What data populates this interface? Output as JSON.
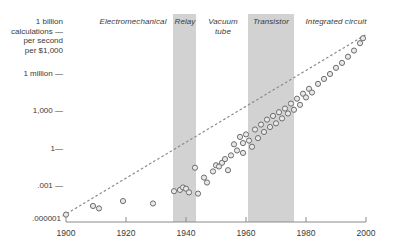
{
  "chart_data": {
    "type": "scatter",
    "title": "",
    "xlabel": "",
    "ylabel": "1 billion calculations per second per $1,000",
    "xlim": [
      1900,
      2000
    ],
    "ylim_log10": [
      -6,
      9
    ],
    "grid": false,
    "legend_position": "none",
    "y_tick_labels": [
      "1 billion\ncalculations —\nper second\nper $1,000",
      "1 million —",
      "1,000 —",
      "1—",
      ".001 —",
      ".000001"
    ],
    "y_tick_values": [
      1000000000,
      1000000,
      1000,
      1,
      0.001,
      1e-06
    ],
    "x_tick_labels": [
      "1900",
      "1920",
      "1940",
      "1960",
      "1980",
      "2000"
    ],
    "x_tick_values": [
      1900,
      1920,
      1940,
      1960,
      1980,
      2000
    ],
    "eras": [
      {
        "name": "Electromechanical",
        "shaded": false,
        "start": 1900,
        "end": 1935,
        "label_x": 1912,
        "label_y_px": 22
      },
      {
        "name": "Relay",
        "shaded": true,
        "start": 1936,
        "end": 1943,
        "label_x": 1939,
        "label_y_px": 22
      },
      {
        "name": "Vacuum\ntube",
        "shaded": false,
        "start": 1944,
        "end": 1960,
        "label_x": 1951,
        "label_y_px": 22
      },
      {
        "name": "Transistor",
        "shaded": true,
        "start": 1961,
        "end": 1976,
        "label_x": 1968,
        "label_y_px": 22
      },
      {
        "name": "Integrated\ncircuit",
        "shaded": false,
        "start": 1977,
        "end": 2000,
        "label_x": 1987,
        "label_y_px": 22
      }
    ],
    "trendline": {
      "x_start": 1899,
      "y_start_log10": -5.5,
      "x_end": 2000,
      "y_end_log10": 9.2,
      "style": "dotted"
    },
    "points": [
      {
        "x": 1900,
        "y_log10": -5.4
      },
      {
        "x": 1909,
        "y_log10": -4.7
      },
      {
        "x": 1911,
        "y_log10": -4.9
      },
      {
        "x": 1919,
        "y_log10": -4.3
      },
      {
        "x": 1929,
        "y_log10": -4.5
      },
      {
        "x": 1936,
        "y_log10": -3.5
      },
      {
        "x": 1938,
        "y_log10": -3.4
      },
      {
        "x": 1939,
        "y_log10": -3.2
      },
      {
        "x": 1940,
        "y_log10": -3.3
      },
      {
        "x": 1941,
        "y_log10": -3.6
      },
      {
        "x": 1943,
        "y_log10": -1.6
      },
      {
        "x": 1944,
        "y_log10": -3.7
      },
      {
        "x": 1946,
        "y_log10": -2.4
      },
      {
        "x": 1947,
        "y_log10": -2.8
      },
      {
        "x": 1949,
        "y_log10": -1.9
      },
      {
        "x": 1950,
        "y_log10": -1.4
      },
      {
        "x": 1951,
        "y_log10": -1.5
      },
      {
        "x": 1952,
        "y_log10": -1.2
      },
      {
        "x": 1953,
        "y_log10": -0.9
      },
      {
        "x": 1954,
        "y_log10": -1.8
      },
      {
        "x": 1955,
        "y_log10": -0.6
      },
      {
        "x": 1956,
        "y_log10": 0.3
      },
      {
        "x": 1957,
        "y_log10": -0.2
      },
      {
        "x": 1958,
        "y_log10": 0.9
      },
      {
        "x": 1959,
        "y_log10": 0.4
      },
      {
        "x": 1959,
        "y_log10": -0.4
      },
      {
        "x": 1960,
        "y_log10": 1.1
      },
      {
        "x": 1961,
        "y_log10": 0.6
      },
      {
        "x": 1962,
        "y_log10": 0.1
      },
      {
        "x": 1963,
        "y_log10": 1.5
      },
      {
        "x": 1964,
        "y_log10": 0.8
      },
      {
        "x": 1965,
        "y_log10": 1.9
      },
      {
        "x": 1966,
        "y_log10": 1.3
      },
      {
        "x": 1967,
        "y_log10": 2.3
      },
      {
        "x": 1968,
        "y_log10": 1.7
      },
      {
        "x": 1969,
        "y_log10": 2.6
      },
      {
        "x": 1970,
        "y_log10": 2.0
      },
      {
        "x": 1971,
        "y_log10": 2.9
      },
      {
        "x": 1972,
        "y_log10": 2.4
      },
      {
        "x": 1973,
        "y_log10": 3.2
      },
      {
        "x": 1974,
        "y_log10": 2.8
      },
      {
        "x": 1975,
        "y_log10": 3.6
      },
      {
        "x": 1976,
        "y_log10": 3.1
      },
      {
        "x": 1977,
        "y_log10": 4.0
      },
      {
        "x": 1978,
        "y_log10": 3.5
      },
      {
        "x": 1979,
        "y_log10": 4.4
      },
      {
        "x": 1980,
        "y_log10": 4.1
      },
      {
        "x": 1981,
        "y_log10": 4.8
      },
      {
        "x": 1982,
        "y_log10": 4.5
      },
      {
        "x": 1984,
        "y_log10": 5.2
      },
      {
        "x": 1986,
        "y_log10": 5.6
      },
      {
        "x": 1988,
        "y_log10": 6.0
      },
      {
        "x": 1990,
        "y_log10": 6.5
      },
      {
        "x": 1992,
        "y_log10": 6.9
      },
      {
        "x": 1994,
        "y_log10": 7.4
      },
      {
        "x": 1996,
        "y_log10": 7.9
      },
      {
        "x": 1998,
        "y_log10": 8.5
      },
      {
        "x": 1999,
        "y_log10": 8.9
      }
    ]
  },
  "colors": {
    "band": "#d2d2d2",
    "text": "#3a3a3a",
    "axis": "#8a8a8a",
    "marker_stroke": "#6e6e6e",
    "marker_fill": "#e8e8e8",
    "trendline": "#8a8a8a"
  }
}
